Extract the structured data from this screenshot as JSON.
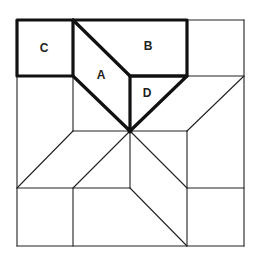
{
  "diagram": {
    "type": "quilt-block-star",
    "labels": {
      "A": "A",
      "B": "B",
      "C": "C",
      "D": "D"
    },
    "colors": {
      "line": "#222222",
      "highlight": "#111111",
      "background": "#ffffff"
    }
  }
}
